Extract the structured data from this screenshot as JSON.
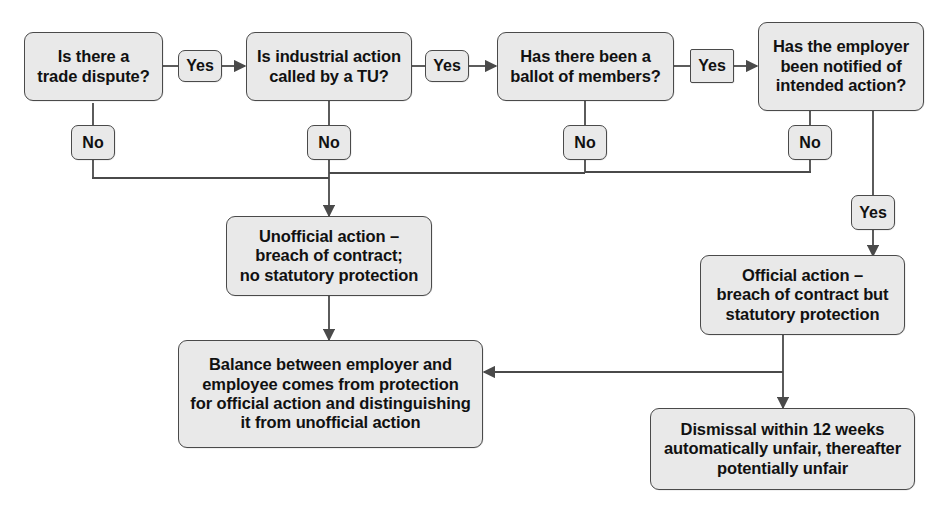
{
  "diagram": {
    "style": {
      "box_fill": "#e9e9e9",
      "box_border": "#4a4a4a",
      "line_color": "#4a4a4a",
      "text_color": "#111111",
      "background": "#ffffff"
    },
    "questions": [
      {
        "id": "q1",
        "text": "Is there a\ntrade dispute?",
        "line1": "Is there a",
        "line2": "trade dispute?"
      },
      {
        "id": "q2",
        "text": "Is industrial action\ncalled by a TU?",
        "line1": "Is industrial action",
        "line2": "called by a TU?"
      },
      {
        "id": "q3",
        "text": "Has there been a\nballot of members?",
        "line1": "Has there been a",
        "line2": "ballot of members?"
      },
      {
        "id": "q4",
        "text": "Has the employer\nbeen notified of\nintended action?",
        "line1": "Has the employer",
        "line2": "been notified of",
        "line3": "intended action?"
      }
    ],
    "edge_labels": {
      "yes1": "Yes",
      "yes2": "Yes",
      "yes3": "Yes",
      "yes4": "Yes",
      "no1": "No",
      "no2": "No",
      "no3": "No",
      "no4": "No"
    },
    "outcomes": [
      {
        "id": "unofficial",
        "line1": "Unofficial action –",
        "line2": "breach of contract;",
        "line3": "no statutory protection"
      },
      {
        "id": "official",
        "line1": "Official action –",
        "line2": "breach of contract but",
        "line3": "statutory protection"
      },
      {
        "id": "balance",
        "line1": "Balance between employer and",
        "line2": "employee comes from protection",
        "line3": "for official action and distinguishing",
        "line4": "it from unofficial action"
      },
      {
        "id": "dismissal",
        "line1": "Dismissal within 12 weeks",
        "line2": "automatically unfair, thereafter",
        "line3": "potentially unfair"
      }
    ]
  }
}
